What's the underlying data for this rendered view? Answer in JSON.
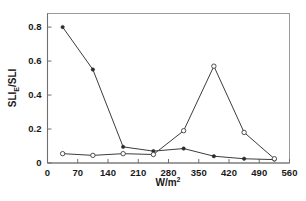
{
  "chart_data": {
    "type": "line",
    "title": "",
    "xlabel": "W/m2",
    "xlabel_base": "W/m",
    "xlabel_exponent": "2",
    "ylabel": "SLIE/SLI",
    "ylabel_part1": "SLI",
    "ylabel_subscript": "E",
    "ylabel_part2": "/SLI",
    "xlim": [
      0,
      560
    ],
    "ylim": [
      0,
      0.88
    ],
    "xticks": [
      0,
      70,
      140,
      210,
      280,
      350,
      420,
      490,
      560
    ],
    "xtick_labels": [
      "0",
      "70",
      "140",
      "210",
      "280",
      "350",
      "420",
      "490",
      "560"
    ],
    "yticks": [
      0,
      0.2,
      0.4,
      0.6,
      0.8
    ],
    "ytick_labels": [
      "0",
      "0.2",
      "0.4",
      "0.6",
      "0.8"
    ],
    "grid": false,
    "legend": "none",
    "x": [
      35,
      105,
      175,
      245,
      315,
      385,
      455,
      525
    ],
    "series": [
      {
        "name": "filled-circle-series",
        "marker": "filled-circle",
        "values": [
          0.8,
          0.55,
          0.095,
          0.07,
          0.085,
          0.04,
          0.025,
          0.02
        ]
      },
      {
        "name": "open-circle-series",
        "marker": "open-circle",
        "values": [
          0.055,
          0.045,
          0.055,
          0.05,
          0.19,
          0.57,
          0.18,
          0.025
        ]
      }
    ]
  }
}
